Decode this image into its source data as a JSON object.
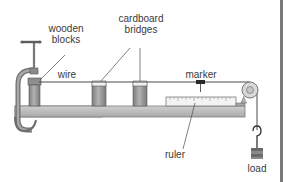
{
  "diagram": {
    "labels": {
      "wooden_blocks_line1": "wooden",
      "wooden_blocks_line2": "blocks",
      "cardboard_bridges_line1": "cardboard",
      "cardboard_bridges_line2": "bridges",
      "wire": "wire",
      "marker": "marker",
      "ruler": "ruler",
      "load": "load"
    },
    "colors": {
      "bench": "#bdbdbd",
      "bench_edge": "#7d7d7d",
      "clamp": "#8a8a8a",
      "block": "#9a9a9a",
      "wire": "#4a4a4a",
      "ruler": "#f2f2f2",
      "label_text": "#3a3a3a",
      "right_bar": "#7a7a7a"
    }
  }
}
